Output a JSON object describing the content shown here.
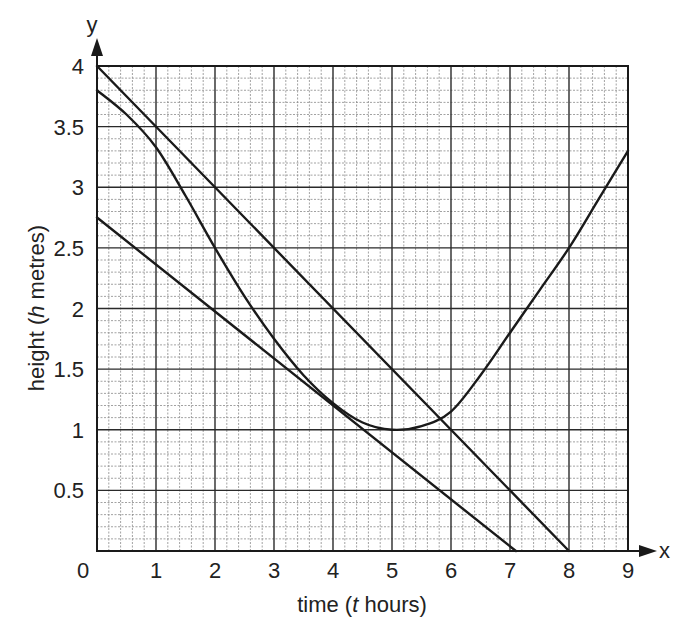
{
  "chart_data": {
    "type": "line",
    "title": "",
    "xlabel": "time (t hours)",
    "xlabel_parts": {
      "pre": "time (",
      "italic": "t",
      "post": " hours)"
    },
    "ylabel": "height (h metres)",
    "ylabel_parts": {
      "pre": "height (",
      "italic": "h",
      "post": " metres)"
    },
    "x_axis_letter": "x",
    "y_axis_letter": "y",
    "xlim": [
      0,
      9
    ],
    "ylim": [
      0,
      4
    ],
    "x_ticks": [
      "0",
      "1",
      "2",
      "3",
      "4",
      "5",
      "6",
      "7",
      "8",
      "9"
    ],
    "y_ticks": [
      {
        "value": 0.5,
        "label": "0.5"
      },
      {
        "value": 1,
        "label": "1"
      },
      {
        "value": 1.5,
        "label": "1.5"
      },
      {
        "value": 2,
        "label": "2"
      },
      {
        "value": 2.5,
        "label": "2.5"
      },
      {
        "value": 3,
        "label": "3"
      },
      {
        "value": 3.5,
        "label": "3.5"
      },
      {
        "value": 4,
        "label": "4"
      }
    ],
    "grid": {
      "major_x": 1,
      "major_y": 0.5,
      "minor_x": 0.2,
      "minor_y": 0.1
    },
    "legend": null,
    "series": [
      {
        "name": "upper straight line",
        "kind": "line",
        "x": [
          0,
          8
        ],
        "y": [
          4.0,
          0.0
        ]
      },
      {
        "name": "lower straight line",
        "kind": "line",
        "x": [
          0,
          7.1
        ],
        "y": [
          2.75,
          0.0
        ]
      },
      {
        "name": "curve",
        "kind": "curve",
        "x": [
          0,
          0.5,
          1,
          1.5,
          2,
          2.5,
          3,
          3.5,
          4,
          4.5,
          5,
          5.5,
          6,
          6.5,
          7,
          7.5,
          8,
          8.5,
          9
        ],
        "y": [
          3.8,
          3.6,
          3.33,
          2.93,
          2.5,
          2.1,
          1.75,
          1.45,
          1.22,
          1.06,
          1.0,
          1.03,
          1.15,
          1.45,
          1.8,
          2.15,
          2.5,
          2.9,
          3.3
        ]
      }
    ]
  }
}
